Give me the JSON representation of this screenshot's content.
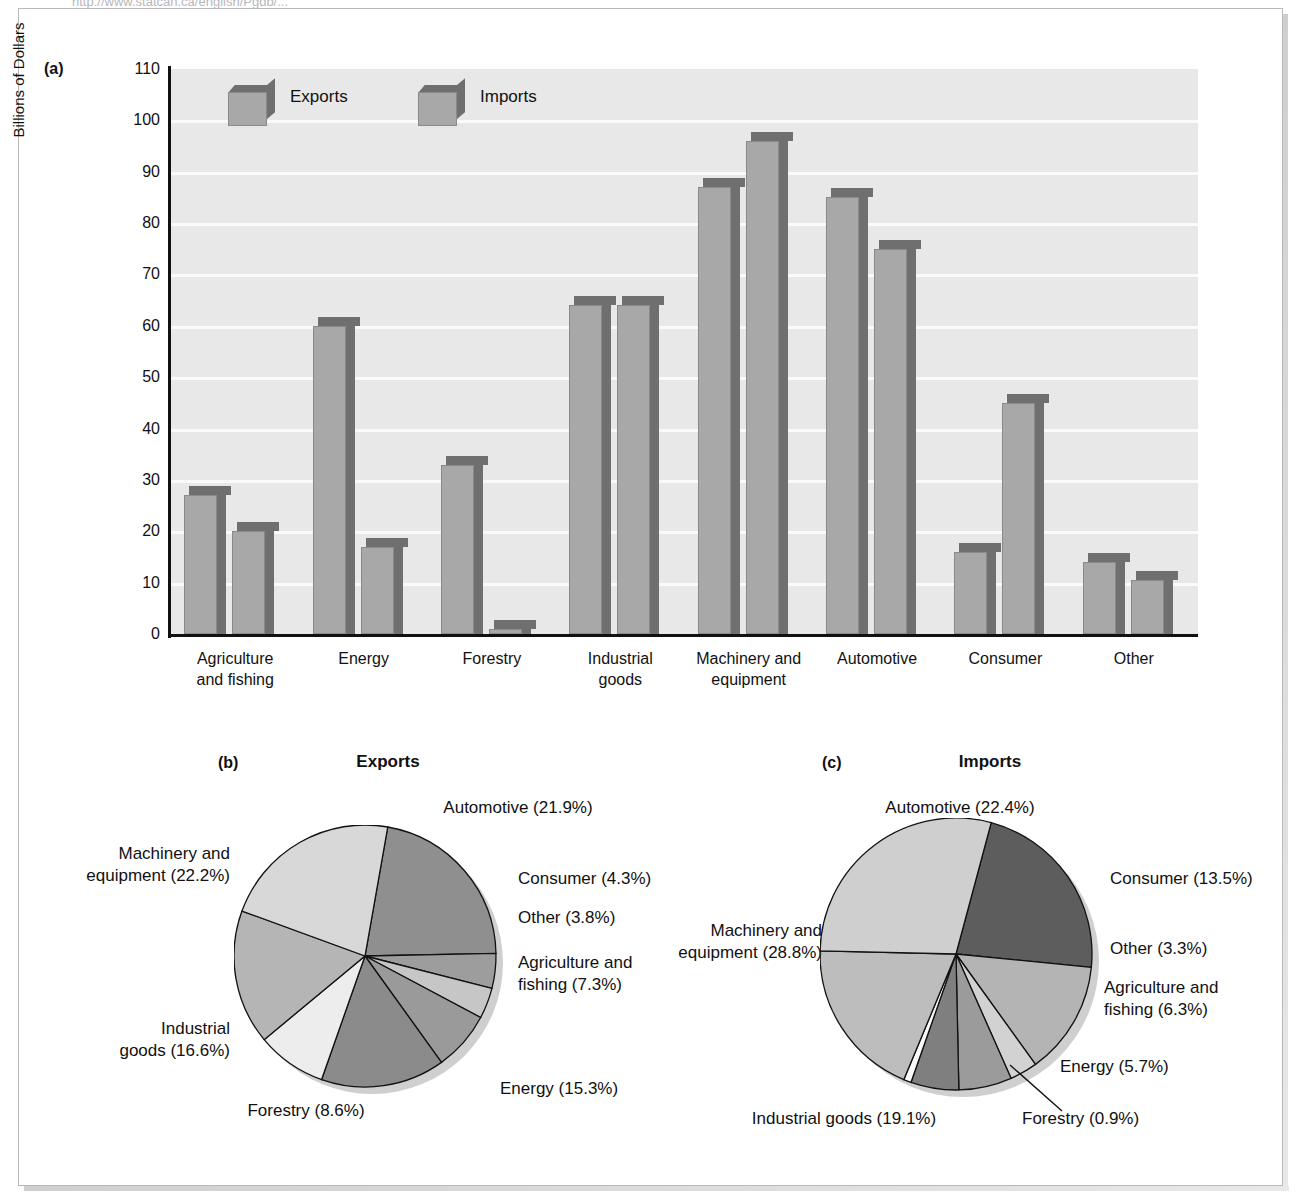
{
  "page": {
    "top_url_text": "http://www.statcan.ca/english/Pgdb/...",
    "panel_a_tag": "(a)",
    "panel_b_tag": "(b)",
    "panel_c_tag": "(c)"
  },
  "chart_data": [
    {
      "type": "bar",
      "id": "panel-a",
      "title": "",
      "xlabel": "",
      "ylabel": "Billions of Dollars",
      "ylim": [
        0,
        110
      ],
      "yticks": [
        110,
        100,
        90,
        80,
        70,
        60,
        50,
        40,
        30,
        20,
        10,
        0
      ],
      "grid": true,
      "legend_position": "top-left-inside",
      "categories": [
        "Agriculture\nand fishing",
        "Energy",
        "Forestry",
        "Industrial\ngoods",
        "Machinery and\nequipment",
        "Automotive",
        "Consumer",
        "Other"
      ],
      "series": [
        {
          "name": "Exports",
          "values": [
            27,
            60,
            33,
            64,
            87,
            85,
            16,
            14
          ]
        },
        {
          "name": "Imports",
          "values": [
            20,
            17,
            1,
            64,
            96,
            75,
            45,
            10.5
          ]
        }
      ]
    },
    {
      "type": "pie",
      "id": "panel-b",
      "title": "Exports",
      "labels": [
        "Automotive (21.9%)",
        "Consumer (4.3%)",
        "Other (3.8%)",
        "Agriculture and\nfishing (7.3%)",
        "Energy (15.3%)",
        "Forestry (8.6%)",
        "Industrial\ngoods (16.6%)",
        "Machinery and\nequipment (22.2%)"
      ],
      "slices": [
        {
          "name": "Automotive",
          "value": 21.9,
          "color": "#8f8f8f"
        },
        {
          "name": "Consumer",
          "value": 4.3,
          "color": "#9d9d9d"
        },
        {
          "name": "Other",
          "value": 3.8,
          "color": "#c6c6c6"
        },
        {
          "name": "Agriculture and fishing",
          "value": 7.3,
          "color": "#9a9a9a"
        },
        {
          "name": "Energy",
          "value": 15.3,
          "color": "#8b8b8b"
        },
        {
          "name": "Forestry",
          "value": 8.6,
          "color": "#ededed"
        },
        {
          "name": "Industrial goods",
          "value": 16.6,
          "color": "#b5b5b5"
        },
        {
          "name": "Machinery and equipment",
          "value": 22.2,
          "color": "#d8d8d8"
        }
      ]
    },
    {
      "type": "pie",
      "id": "panel-c",
      "title": "Imports",
      "labels": [
        "Automotive (22.4%)",
        "Consumer (13.5%)",
        "Other (3.3%)",
        "Agriculture and\nfishing (6.3%)",
        "Energy (5.7%)",
        "Forestry (0.9%)",
        "Industrial goods (19.1%)",
        "Machinery and\nequipment (28.8%)"
      ],
      "slices": [
        {
          "name": "Automotive",
          "value": 22.4,
          "color": "#5d5d5d"
        },
        {
          "name": "Consumer",
          "value": 13.5,
          "color": "#b4b4b4"
        },
        {
          "name": "Other",
          "value": 3.3,
          "color": "#d2d2d2"
        },
        {
          "name": "Agriculture and fishing",
          "value": 6.3,
          "color": "#9b9b9b"
        },
        {
          "name": "Energy",
          "value": 5.7,
          "color": "#7f7f7f"
        },
        {
          "name": "Forestry",
          "value": 0.9,
          "color": "#fafafa"
        },
        {
          "name": "Industrial goods",
          "value": 19.1,
          "color": "#bdbdbd"
        },
        {
          "name": "Machinery and equipment",
          "value": 28.8,
          "color": "#cfcfcf"
        }
      ]
    }
  ]
}
